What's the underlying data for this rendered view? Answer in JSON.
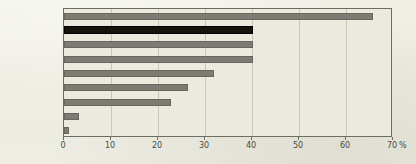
{
  "chart_data": {
    "type": "bar",
    "orientation": "horizontal",
    "title": "",
    "xlabel": "%",
    "ylabel": "",
    "xlim": [
      0,
      70
    ],
    "xticks": [
      0,
      10,
      20,
      30,
      40,
      50,
      60,
      70
    ],
    "xtick_labels": [
      "0",
      "10",
      "20",
      "30",
      "40",
      "50",
      "60",
      "70"
    ],
    "unit_label": "%",
    "grid": true,
    "legend": "none",
    "categories": [
      "ベトナム",
      "タイ",
      "ミャンマー",
      "カンボジア",
      "インドネシア",
      "中国",
      "マレーシア",
      "韓国",
      "日本"
    ],
    "values": [
      65.7,
      40.2,
      40.3,
      40.3,
      32.0,
      26.4,
      22.8,
      3.2,
      1.0
    ],
    "highlight_index": 1,
    "colors": {
      "bar": "#7c7c74",
      "bar_highlight": "#16130f",
      "background": "#eceadf",
      "page_background": "#efeee4",
      "axis": "#6d6d64",
      "gridline": "#c9c7ba",
      "text": "#4a4a44"
    }
  }
}
